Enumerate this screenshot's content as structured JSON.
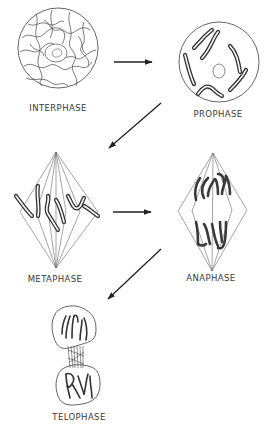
{
  "diagram": {
    "stages": [
      {
        "id": "interphase",
        "label": "INTERPHASE"
      },
      {
        "id": "prophase",
        "label": "PROPHASE"
      },
      {
        "id": "metaphase",
        "label": "METAPHASE"
      },
      {
        "id": "anaphase",
        "label": "ANAPHASE"
      },
      {
        "id": "telophase",
        "label": "TELOPHASE"
      }
    ],
    "flow": [
      {
        "from": "interphase",
        "to": "prophase"
      },
      {
        "from": "prophase",
        "to": "metaphase"
      },
      {
        "from": "metaphase",
        "to": "anaphase"
      },
      {
        "from": "anaphase",
        "to": "telophase"
      }
    ],
    "colors": {
      "background": "#ffffff",
      "line": "#333333",
      "text": "#3a3a3a"
    }
  }
}
